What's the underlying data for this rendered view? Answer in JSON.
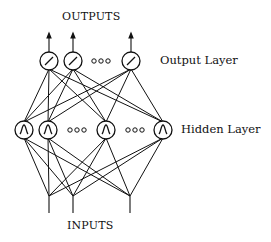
{
  "diagram": {
    "top_label": "OUTPUTS",
    "bottom_label": "INPUTS",
    "output_layer_label": "Output Layer",
    "hidden_layer_label": "Hidden Layer",
    "ellipsis": "ooo",
    "output_nodes": [
      {
        "x": 49,
        "y": 61,
        "symbol": "linear"
      },
      {
        "x": 73,
        "y": 61,
        "symbol": "linear"
      },
      {
        "x": 131,
        "y": 61,
        "symbol": "linear"
      }
    ],
    "hidden_nodes": [
      {
        "x": 24,
        "y": 130,
        "symbol": "bump"
      },
      {
        "x": 48,
        "y": 130,
        "symbol": "bump"
      },
      {
        "x": 106,
        "y": 130,
        "symbol": "bump"
      },
      {
        "x": 163,
        "y": 130,
        "symbol": "bump"
      }
    ],
    "inputs": [
      {
        "x": 49,
        "y": 196
      },
      {
        "x": 73,
        "y": 196
      },
      {
        "x": 130,
        "y": 196
      }
    ],
    "colors": {
      "stroke": "#111111",
      "background": "#ffffff"
    }
  }
}
